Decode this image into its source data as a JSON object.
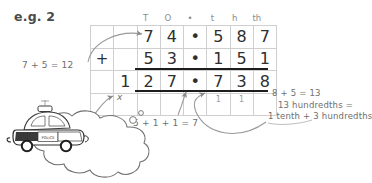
{
  "title": "e.g. 2",
  "grid": {
    "column_headers": [
      "",
      "",
      "T",
      "O",
      "•",
      "t",
      "h",
      "th"
    ],
    "rows": [
      {
        "name": "addend-1",
        "cells": [
          "",
          "",
          "7",
          "4",
          "•",
          "5",
          "8",
          "7"
        ]
      },
      {
        "name": "addend-2",
        "cells": [
          "+",
          "",
          "5",
          "3",
          "•",
          "1",
          "5",
          "1"
        ]
      },
      {
        "name": "answer",
        "cells": [
          "",
          "1",
          "2",
          "7",
          "•",
          "7",
          "3",
          "8"
        ]
      },
      {
        "name": "carry",
        "cells": [
          "",
          "",
          "",
          "",
          "",
          "1",
          "1",
          ""
        ]
      }
    ]
  },
  "annotations": {
    "left": "7 + 5 = 12",
    "middle": "5 + 1 + 1 = 7",
    "right_line1": "8 + 5 = 13",
    "right_line2": "13 hundredths =",
    "right_line3": "1 tenth + 3 hundredths",
    "cross_mark": "x"
  },
  "bubble": {
    "line1": "Do NOT put the final",
    "line2": "carry digit",
    "line2_emphasis": "here!"
  },
  "car": {
    "label": "POLICE"
  },
  "colors": {
    "ink": "#3d3d3d",
    "pencil": "#6e6e6e",
    "grid_line": "#cfcfcf",
    "rule": "#1d1d1d",
    "faint": "#a5a5a5"
  }
}
